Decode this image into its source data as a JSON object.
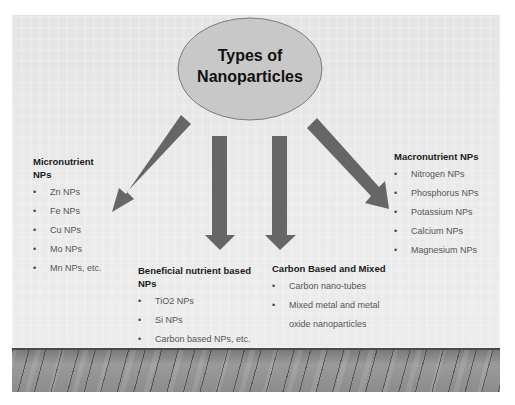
{
  "title": {
    "line1": "Types of",
    "line2": "Nanoparticles"
  },
  "colors": {
    "ellipse_fill": "#c8c8c8",
    "ellipse_stroke": "#7a7a7a",
    "arrow": "#666666",
    "background": "#e8e8e8"
  },
  "groups": {
    "micronutrient": {
      "heading_line1": "Micronutrient",
      "heading_line2": "NPs",
      "items": [
        "Zn NPs",
        "Fe NPs",
        "Cu NPs",
        "Mo NPs",
        "Mn NPs, etc."
      ]
    },
    "beneficial": {
      "heading_line1": "Beneficial nutrient based",
      "heading_line2": "NPs",
      "items": [
        "TiO2 NPs",
        "Si NPs",
        "Carbon based NPs, etc."
      ]
    },
    "carbon": {
      "heading": "Carbon Based and Mixed",
      "items": [
        "Carbon nano-tubes",
        "Mixed metal and metal"
      ],
      "item_continuation": "oxide nanoparticles"
    },
    "macronutrient": {
      "heading": "Macronutrient NPs",
      "items": [
        "Nitrogen NPs",
        "Phosphorus NPs",
        "Potassium NPs",
        "Calcium NPs",
        "Magnesium NPs"
      ]
    }
  },
  "bullet_glyph": "•"
}
